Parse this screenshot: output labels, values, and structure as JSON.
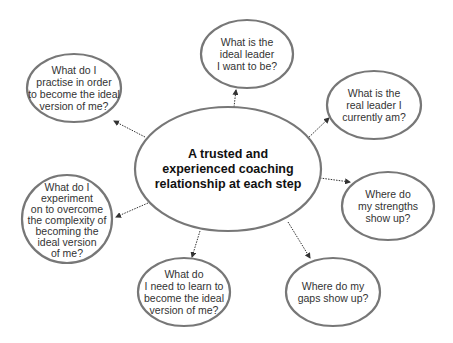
{
  "colors": {
    "outline": "#777777",
    "arrow": "#333333",
    "text": "#333333"
  },
  "center": {
    "text": "A trusted and experienced coaching relationship at each step",
    "lines": [
      "A trusted and",
      "experienced coaching",
      "relationship at each step"
    ]
  },
  "nodes": [
    {
      "id": "ideal-leader",
      "text": "What is the ideal leader I want to be?",
      "lines": [
        "What is the",
        "ideal leader",
        "I want to be?"
      ]
    },
    {
      "id": "real-leader",
      "text": "What is the real leader I currently am?",
      "lines": [
        "What is the",
        "real leader I",
        "currently am?"
      ]
    },
    {
      "id": "strengths",
      "text": "Where do my strengths show up?",
      "lines": [
        "Where do",
        "my strengths",
        "show up?"
      ]
    },
    {
      "id": "gaps",
      "text": "Where do my gaps show up?",
      "lines": [
        "Where do my",
        "gaps show up?"
      ]
    },
    {
      "id": "learn",
      "text": "What do I need to learn to become the ideal version of me?",
      "lines": [
        "What do",
        "I need to learn to",
        "become the ideal",
        "version of me?"
      ]
    },
    {
      "id": "experiment",
      "text": "What do I experiment on to overcome the complexity of becoming the ideal version of me?",
      "lines": [
        "What do I",
        "experiment",
        "on to overcome",
        "the complexity of",
        "becoming the",
        "ideal version",
        "of me?"
      ]
    },
    {
      "id": "practise",
      "text": "What do I practise in order to become the ideal version of me?",
      "lines": [
        "What do I",
        "practise in order",
        "to become the ideal",
        "version of me?"
      ]
    }
  ]
}
